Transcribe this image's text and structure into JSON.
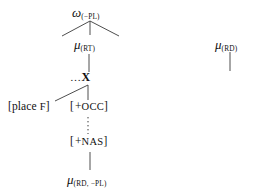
{
  "diagram": {
    "type": "phonological-representation-tree",
    "nodes": {
      "omega_root": {
        "symbol": "ω",
        "subscript": "(−PL)",
        "full": "ω(−PL)"
      },
      "mu_rt": {
        "symbol": "μ",
        "subscript": "(RT)",
        "full": "μ(RT)"
      },
      "x_node": {
        "ellipsis": "…",
        "symbol": "X",
        "full": "…X"
      },
      "place_f": {
        "open": "[",
        "word": "place",
        "feature": "F",
        "close": "]",
        "full": "[place F]"
      },
      "plus_occ": {
        "open": "[",
        "sign": "+",
        "feature": "OCC",
        "close": "]",
        "full": "[+OCC]"
      },
      "plus_nas": {
        "open": "[",
        "sign": "+",
        "feature": "NAS",
        "close": "]",
        "full": "[+NAS]"
      },
      "mu_rd_minus_pl": {
        "symbol": "μ",
        "subscript": "(RD, −PL)",
        "full": "μ(RD, −PL)"
      },
      "mu_rd": {
        "symbol": "μ",
        "subscript": "(RD)",
        "full": "μ(RD)"
      }
    },
    "edges": [
      {
        "name": "omega-to-left-branch",
        "style": "solid"
      },
      {
        "name": "omega-to-mu-rt",
        "style": "solid"
      },
      {
        "name": "omega-to-right-branch",
        "style": "solid"
      },
      {
        "name": "mu-rt-to-x",
        "style": "solid"
      },
      {
        "name": "x-to-place-f",
        "style": "solid"
      },
      {
        "name": "x-to-plus-occ",
        "style": "solid"
      },
      {
        "name": "plus-occ-to-plus-nas",
        "style": "dotted"
      },
      {
        "name": "plus-nas-to-mu-rd-minus-pl",
        "style": "solid"
      },
      {
        "name": "mu-rd-dangling-branch",
        "style": "solid"
      }
    ],
    "colors": {
      "ink": "#111111",
      "line": "#3a3a3a",
      "background": "#ffffff"
    }
  }
}
